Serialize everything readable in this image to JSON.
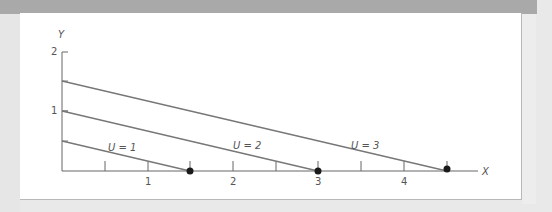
{
  "figure": {
    "y_axis_label": "Y",
    "x_axis_label": "X",
    "y_ticks": [
      {
        "value": 2,
        "label": "2"
      },
      {
        "value": 1,
        "label": "1"
      }
    ],
    "x_ticks": [
      {
        "value": 0.5,
        "label": ""
      },
      {
        "value": 1,
        "label": "1"
      },
      {
        "value": 1.5,
        "label": ""
      },
      {
        "value": 2,
        "label": "2"
      },
      {
        "value": 2.5,
        "label": ""
      },
      {
        "value": 3,
        "label": "3"
      },
      {
        "value": 3.5,
        "label": ""
      },
      {
        "value": 4,
        "label": "4"
      },
      {
        "value": 4.5,
        "label": ""
      }
    ],
    "lines": [
      {
        "label": "U = 1",
        "y_intercept": 0.5,
        "x_intercept": 1.5
      },
      {
        "label": "U = 2",
        "y_intercept": 1,
        "x_intercept": 3
      },
      {
        "label": "U = 3",
        "y_intercept": 1.5,
        "x_intercept": 4.5
      }
    ],
    "colors": {
      "line": "#777777",
      "axis": "#666666",
      "dot": "#1a1a1a"
    }
  }
}
